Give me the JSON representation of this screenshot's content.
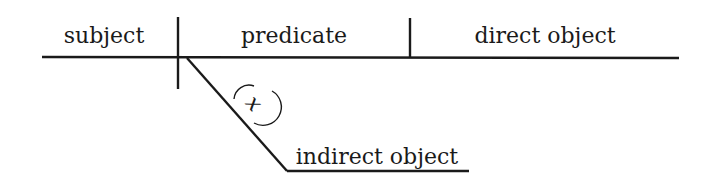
{
  "diagram": {
    "type": "sentence-diagram",
    "labels": {
      "subject": "subject",
      "predicate": "predicate",
      "direct_object": "direct object",
      "indirect_object": "indirect object",
      "preposition_marker": "x"
    },
    "colors": {
      "ink": "#1a1a1a",
      "background": "#ffffff"
    }
  }
}
